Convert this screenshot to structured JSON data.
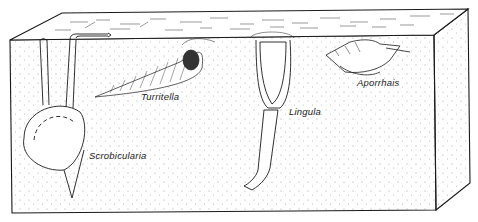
{
  "diagram": {
    "type": "block-diagram",
    "colors": {
      "line": "#1a1a1a",
      "background": "#ffffff",
      "stipple": "#9a9a9a"
    },
    "organisms": [
      {
        "id": "scrobicularia",
        "label": "Scrobicularia"
      },
      {
        "id": "turritella",
        "label": "Turritella"
      },
      {
        "id": "lingula",
        "label": "Lingula"
      },
      {
        "id": "aporrhais",
        "label": "Aporrhais"
      }
    ]
  }
}
